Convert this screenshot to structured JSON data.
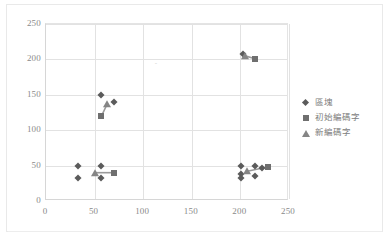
{
  "chart_data": {
    "type": "scatter",
    "title": "",
    "subtitle": "",
    "xlabel": "",
    "ylabel": "",
    "xlim": [
      0,
      250
    ],
    "ylim": [
      0,
      250
    ],
    "xticks": [
      0,
      50,
      100,
      150,
      200,
      250
    ],
    "yticks": [
      0,
      50,
      100,
      150,
      200,
      250
    ],
    "grid": true,
    "legend_position": "right",
    "series": [
      {
        "name": "區塊",
        "marker": "diamond",
        "color": "#5b5b5b",
        "points": [
          [
            33,
            50
          ],
          [
            33,
            32
          ],
          [
            57,
            50
          ],
          [
            57,
            32
          ],
          [
            57,
            150
          ],
          [
            70,
            140
          ],
          [
            203,
            207
          ],
          [
            201,
            50
          ],
          [
            201,
            38
          ],
          [
            201,
            32
          ],
          [
            215,
            50
          ],
          [
            215,
            35
          ],
          [
            222,
            46
          ]
        ]
      },
      {
        "name": "初始編碼字",
        "marker": "square",
        "color": "#6f6f6f",
        "points": [
          [
            70,
            40
          ],
          [
            57,
            120
          ],
          [
            215,
            201
          ],
          [
            228,
            48
          ]
        ]
      },
      {
        "name": "新編碼字",
        "marker": "triangle",
        "color": "#858585",
        "points": [
          [
            50,
            40
          ],
          [
            63,
            137
          ],
          [
            205,
            205
          ],
          [
            207,
            42
          ]
        ]
      }
    ],
    "connectors": [
      {
        "from": [
          50,
          40
        ],
        "to": [
          70,
          40
        ]
      },
      {
        "from": [
          57,
          120
        ],
        "to": [
          63,
          137
        ]
      },
      {
        "from": [
          205,
          205
        ],
        "to": [
          215,
          201
        ]
      },
      {
        "from": [
          207,
          42
        ],
        "to": [
          228,
          48
        ]
      }
    ]
  },
  "axes": {
    "y_tick_labels": [
      "250",
      "200",
      "150",
      "100",
      "50",
      "0"
    ],
    "x_tick_labels": [
      "0",
      "50",
      "100",
      "150",
      "200",
      "250"
    ]
  },
  "legend": {
    "items": [
      {
        "label": "區塊",
        "marker": "diamond"
      },
      {
        "label": "初始編碼字",
        "marker": "square"
      },
      {
        "label": "新編碼字",
        "marker": "triangle"
      }
    ]
  },
  "annotations": {
    "stray_mark": "˜"
  },
  "colors": {
    "series_diamond": "#5b5b5b",
    "series_square": "#6f6f6f",
    "series_triangle": "#858585",
    "gridline": "#e2e2e2",
    "axis_text": "#8a8a8a",
    "legend_text": "#7d7d7d",
    "frame": "#e9e9e9",
    "background": "#ffffff"
  }
}
